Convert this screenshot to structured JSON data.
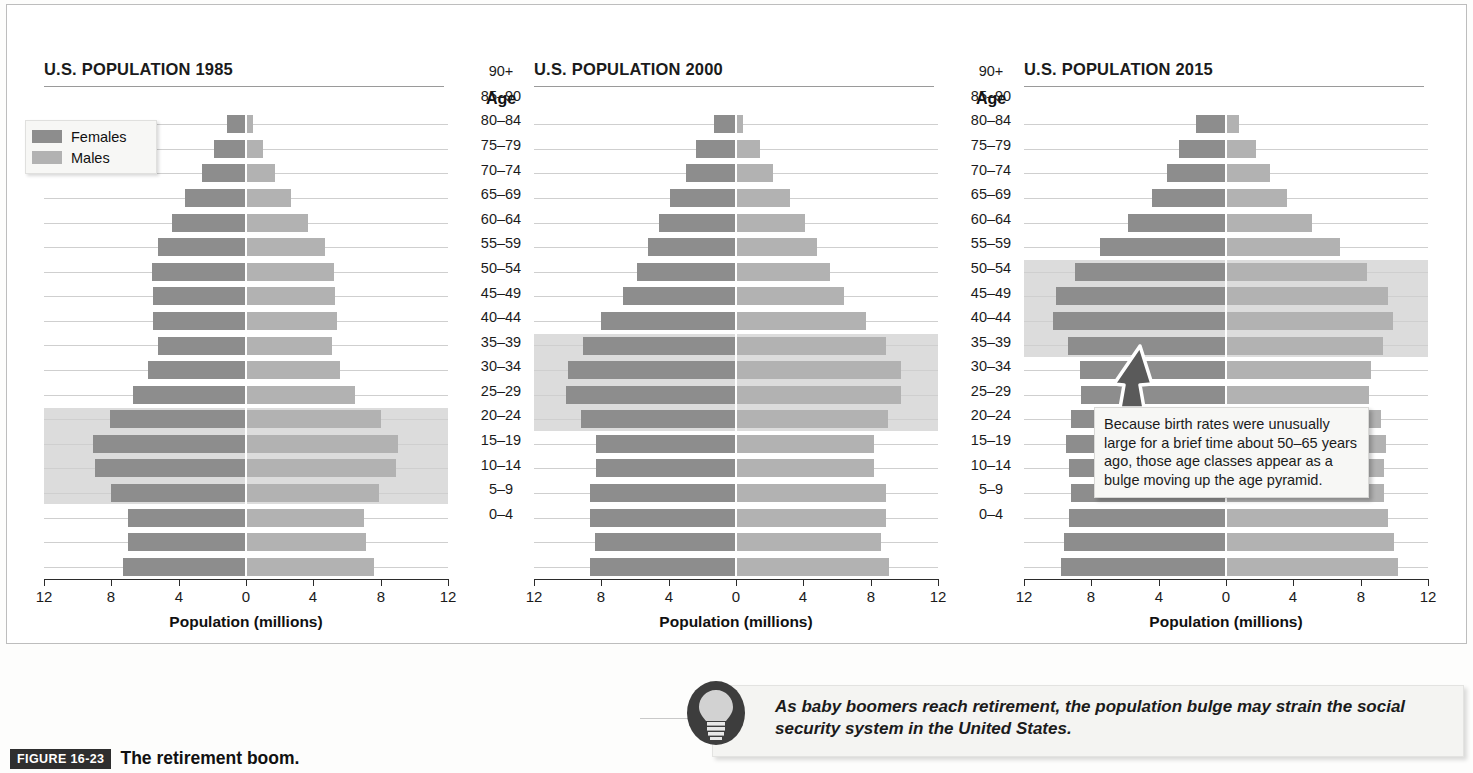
{
  "header": {
    "title": "BABY BOOMERS AND RETIREMENT"
  },
  "legend": {
    "females_label": "Females",
    "males_label": "Males",
    "female_color": "#8d8d8d",
    "male_color": "#b2b2b2"
  },
  "age_column": {
    "header": "Age",
    "labels": [
      "90+",
      "85–90",
      "80–84",
      "75–79",
      "70–74",
      "65–69",
      "60–64",
      "55–59",
      "50–54",
      "45–49",
      "40–44",
      "35–39",
      "30–34",
      "25–29",
      "20–24",
      "15–19",
      "10–14",
      "5–9",
      "0–4"
    ]
  },
  "axis": {
    "title": "Population (millions)",
    "tick_labels": [
      "12",
      "8",
      "4",
      "0",
      "4",
      "8",
      "12"
    ],
    "tick_values": [
      -12,
      -8,
      -4,
      0,
      4,
      8,
      12
    ],
    "min": -12,
    "max": 12
  },
  "panels": [
    {
      "id": "1985",
      "title_prefix": "U.S. POPULATION",
      "title_year": "1985"
    },
    {
      "id": "2000",
      "title_prefix": "U.S. POPULATION",
      "title_year": "2000"
    },
    {
      "id": "2015",
      "title_prefix": "U.S. POPULATION",
      "title_year": "2015"
    }
  ],
  "callout": {
    "text": "Because birth rates were unusually large for a brief time about 50–65 years ago, those age classes appear as a bulge moving up the age pyramid."
  },
  "bulb_note": {
    "text": "As baby boomers reach retirement, the population bulge may strain the social security system in the United States.",
    "icon": "lightbulb-icon"
  },
  "caption": {
    "tag": "FIGURE 16-23",
    "text": "The retirement boom."
  },
  "chart_data": {
    "type": "bar",
    "subtype": "population-pyramid",
    "title": "BABY BOOMERS AND RETIREMENT",
    "xlabel": "Population (millions)",
    "ylabel": "Age",
    "xlim": [
      -12,
      12
    ],
    "xticks": [
      -12,
      -8,
      -4,
      0,
      4,
      8,
      12
    ],
    "xticklabels": [
      "12",
      "8",
      "4",
      "0",
      "4",
      "8",
      "12"
    ],
    "grid": true,
    "legend": [
      "Females",
      "Males"
    ],
    "legend_position": "top-left of first panel",
    "categories": [
      "90+",
      "85–90",
      "80–84",
      "75–79",
      "70–74",
      "65–69",
      "60–64",
      "55–59",
      "50–54",
      "45–49",
      "40–44",
      "35–39",
      "30–34",
      "25–29",
      "20–24",
      "15–19",
      "10–14",
      "5–9",
      "0–4"
    ],
    "panels": [
      {
        "year": "1985",
        "title": "U.S. POPULATION 1985",
        "highlight_band_categories": [
          "30–34",
          "25–29",
          "20–24",
          "15–19"
        ],
        "series": [
          {
            "name": "Females",
            "side": "left",
            "values": [
              1.1,
              1.9,
              2.6,
              3.6,
              4.4,
              5.2,
              5.6,
              5.5,
              5.5,
              5.2,
              5.8,
              6.7,
              8.1,
              9.1,
              9.0,
              8.0,
              7.0,
              7.0,
              7.3
            ]
          },
          {
            "name": "Males",
            "side": "right",
            "values": [
              0.4,
              1.0,
              1.7,
              2.7,
              3.7,
              4.7,
              5.2,
              5.3,
              5.4,
              5.1,
              5.6,
              6.5,
              8.0,
              9.0,
              8.9,
              7.9,
              7.0,
              7.1,
              7.6
            ]
          }
        ]
      },
      {
        "year": "2000",
        "title": "U.S. POPULATION 2000",
        "highlight_band_categories": [
          "45–49",
          "40–44",
          "35–39",
          "30–34"
        ],
        "series": [
          {
            "name": "Females",
            "side": "left",
            "values": [
              1.3,
              2.4,
              3.0,
              3.9,
              4.6,
              5.2,
              5.9,
              6.7,
              8.0,
              9.1,
              10.0,
              10.1,
              9.2,
              8.3,
              8.3,
              8.7,
              8.7,
              8.4,
              8.7
            ]
          },
          {
            "name": "Males",
            "side": "right",
            "values": [
              0.4,
              1.4,
              2.2,
              3.2,
              4.1,
              4.8,
              5.6,
              6.4,
              7.7,
              8.9,
              9.8,
              9.8,
              9.0,
              8.2,
              8.2,
              8.9,
              8.9,
              8.6,
              9.1
            ]
          }
        ]
      },
      {
        "year": "2015",
        "title": "U.S. POPULATION 2015",
        "highlight_band_categories": [
          "60–64",
          "55–59",
          "50–54",
          "45–49"
        ],
        "series": [
          {
            "name": "Females",
            "side": "left",
            "values": [
              1.8,
              2.8,
              3.5,
              4.4,
              5.8,
              7.5,
              9.0,
              10.1,
              10.3,
              9.4,
              8.7,
              8.6,
              9.2,
              9.5,
              9.3,
              9.2,
              9.3,
              9.6,
              9.8
            ]
          },
          {
            "name": "Males",
            "side": "right",
            "values": [
              0.8,
              1.8,
              2.6,
              3.6,
              5.1,
              6.8,
              8.4,
              9.6,
              9.9,
              9.3,
              8.6,
              8.5,
              9.2,
              9.5,
              9.4,
              9.4,
              9.6,
              10.0,
              10.2
            ]
          }
        ]
      }
    ]
  }
}
